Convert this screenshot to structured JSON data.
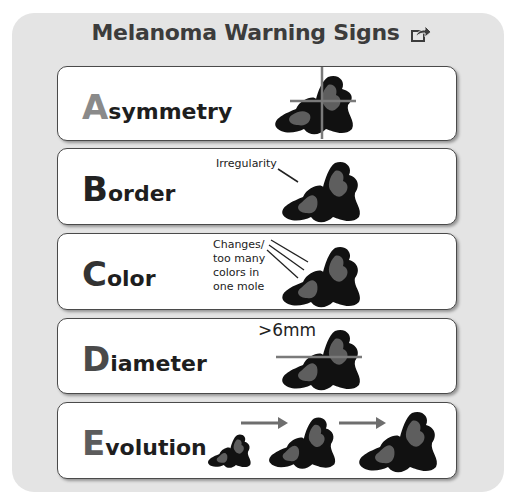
{
  "title": "Melanoma Warning Signs",
  "share_icon": "share-icon",
  "signs": [
    {
      "letter": "A",
      "rest": "symmetry",
      "letter_color": "#8a8a8a",
      "note": ""
    },
    {
      "letter": "B",
      "rest": "order",
      "letter_color": "#222222",
      "note": "Irregularity"
    },
    {
      "letter": "C",
      "rest": "olor",
      "letter_color": "#333333",
      "note_lines": [
        "Changes/",
        "too many",
        "colors in",
        "one mole"
      ]
    },
    {
      "letter": "D",
      "rest": "iameter",
      "letter_color": "#4a4a4a",
      "note": ">6mm"
    },
    {
      "letter": "E",
      "rest": "volution",
      "letter_color": "#5c5c5c",
      "note": ""
    }
  ],
  "colors": {
    "panel": "#e4e4e4",
    "mole_outer": "#111111",
    "mole_inner": "#3a3a3a",
    "mole_patch": "#5e5e5e",
    "guide_line": "#7a7a7a"
  }
}
